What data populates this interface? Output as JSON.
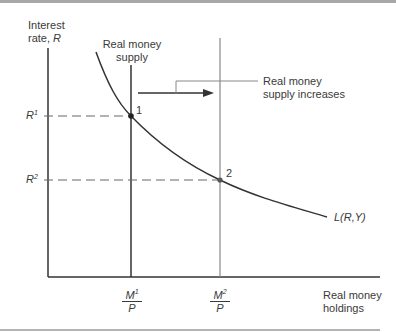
{
  "diagram": {
    "title": "",
    "y_axis": {
      "label_line1": "Interest",
      "label_line2": "rate, ",
      "label_var": "R"
    },
    "x_axis": {
      "label_line1": "Real money",
      "label_line2": "holdings"
    },
    "supply_label": {
      "line1": "Real money",
      "line2": "supply"
    },
    "shift_label": {
      "line1": "Real money",
      "line2": "supply increases"
    },
    "demand_curve_label": "L(R,Y)",
    "y_ticks": [
      {
        "base": "R",
        "sup": "1"
      },
      {
        "base": "R",
        "sup": "2"
      }
    ],
    "x_ticks": [
      {
        "num_base": "M",
        "num_sup": "1",
        "den": "P"
      },
      {
        "num_base": "M",
        "num_sup": "2",
        "den": "P"
      }
    ],
    "points": [
      {
        "label": "1"
      },
      {
        "label": "2"
      }
    ],
    "colors": {
      "axis": "#333333",
      "curve": "#333333",
      "supply2": "#888888",
      "dashed": "#666666",
      "frame_rule": "#9a9a9a"
    }
  }
}
